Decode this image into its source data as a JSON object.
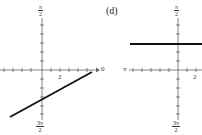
{
  "panels": [
    {
      "id": "left",
      "label": "",
      "axis_labels": {
        "top_num": "π",
        "top_den": "2",
        "bottom_num": "3π",
        "bottom_den": "2",
        "tick_label": "2",
        "axis_end": "0"
      },
      "line": {
        "x1": 10,
        "y1": 117,
        "x2": 92,
        "y2": 72
      }
    },
    {
      "id": "right",
      "label": "(d)",
      "axis_labels": {
        "top_num": "π",
        "top_den": "2",
        "bottom_num": "3π",
        "bottom_den": "2",
        "tick_label": "2",
        "axis_start": "π"
      },
      "line": {
        "x1": 130,
        "y1": 44,
        "x2": 202,
        "y2": 44
      }
    }
  ],
  "colors": {
    "axis": "#555555",
    "curve": "#111111"
  }
}
